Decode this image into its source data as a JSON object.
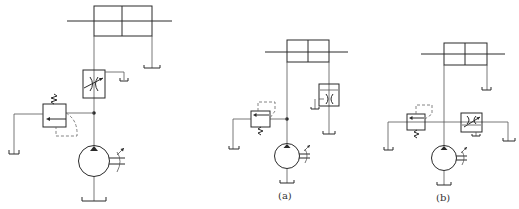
{
  "figure": {
    "type": "hydraulic-circuit",
    "colors": {
      "line": "#2a2a2a",
      "background": "#ffffff"
    },
    "diagrams": [
      {
        "id": "main",
        "caption": "",
        "components": [
          "double-rod-cylinder",
          "throttle-valve",
          "relief-valve",
          "variable-pump",
          "tank"
        ]
      },
      {
        "id": "a",
        "caption": "(a)",
        "components": [
          "double-rod-cylinder",
          "relief-valve",
          "throttle-valve-on-return",
          "variable-pump",
          "tank"
        ]
      },
      {
        "id": "b",
        "caption": "(b)",
        "components": [
          "double-rod-cylinder",
          "relief-valve",
          "throttle-valve-bypass",
          "variable-pump",
          "tank"
        ]
      }
    ]
  },
  "captions": {
    "a": "(a)",
    "b": "(b)"
  }
}
